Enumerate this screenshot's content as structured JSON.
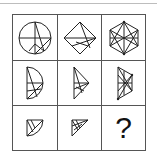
{
  "puzzle": {
    "rows": 3,
    "cols": 3,
    "cells": [
      {
        "row": 1,
        "col": 1,
        "shape": "circle-with-lines-icon"
      },
      {
        "row": 1,
        "col": 2,
        "shape": "diamond-with-lines-icon"
      },
      {
        "row": 1,
        "col": 3,
        "shape": "hexagon-with-lines-icon"
      },
      {
        "row": 2,
        "col": 1,
        "shape": "half-circle-with-lines-icon"
      },
      {
        "row": 2,
        "col": 2,
        "shape": "half-diamond-with-lines-icon"
      },
      {
        "row": 2,
        "col": 3,
        "shape": "half-hexagon-with-lines-icon"
      },
      {
        "row": 3,
        "col": 1,
        "shape": "quarter-circle-with-lines-icon"
      },
      {
        "row": 3,
        "col": 2,
        "shape": "quarter-diamond-with-lines-icon"
      },
      {
        "row": 3,
        "col": 3,
        "shape": "unknown",
        "text": "?"
      }
    ],
    "answer_placeholder": "?"
  },
  "colors": {
    "line": "#222222",
    "border": "#555555",
    "background": "#ffffff"
  }
}
